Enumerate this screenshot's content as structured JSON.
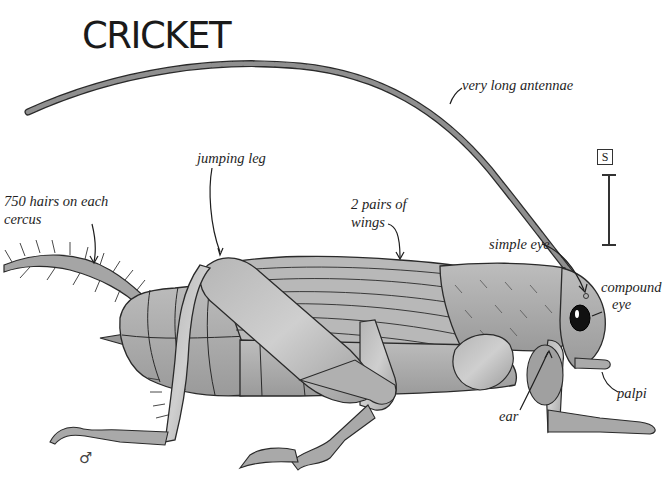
{
  "title": "CRICKET",
  "labels": {
    "antennae": "very long antennae",
    "jumping_leg": "jumping leg",
    "cercus_line1": "750 hairs on each",
    "cercus_line2": "cercus",
    "wings_line1": "2 pairs of",
    "wings_line2": "wings",
    "simple_eye": "simple eye",
    "compound_eye_line1": "compound",
    "compound_eye_line2": "eye",
    "ear": "ear",
    "palpi": "palpi"
  },
  "scale": {
    "symbol": "S"
  },
  "sex_symbol": "♂",
  "colors": {
    "body_fill": "#a9a9a9",
    "body_light": "#c4c4c4",
    "outline": "#2a2a2a",
    "text": "#1e1e1e",
    "background": "#ffffff"
  }
}
